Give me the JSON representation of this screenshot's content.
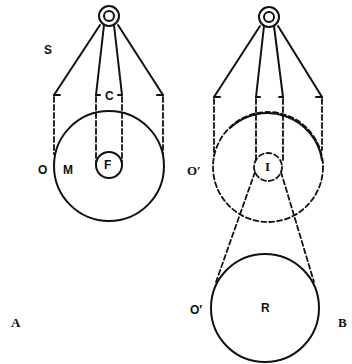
{
  "figure": {
    "panels": [
      {
        "id": "A",
        "panel_label": "A",
        "labels": {
          "s": "S",
          "c": "C",
          "o": "O",
          "m": "M",
          "f": "F"
        }
      },
      {
        "id": "B",
        "panel_label": "B",
        "labels": {
          "o_prime": "O′",
          "i": "I",
          "o_prime_lower": "O′",
          "r": "R"
        }
      }
    ],
    "colors": {
      "ink": "#111111",
      "background": "#ffffff"
    }
  }
}
